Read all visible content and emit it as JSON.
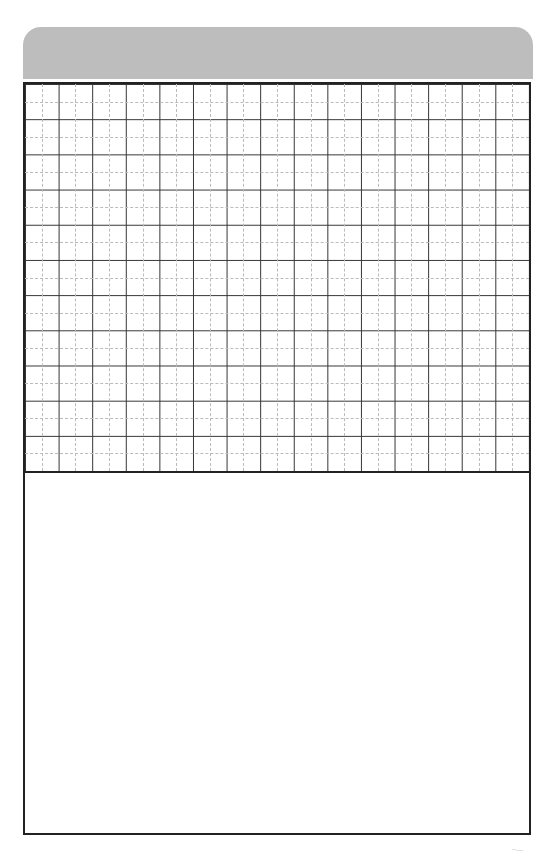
{
  "page": {
    "header_band_color": "#bdbdbd",
    "border_color": "#222222",
    "grid": {
      "columns": 15,
      "rows": 11,
      "solid_line_color": "#333333",
      "dashed_line_color": "#bbbbbb"
    },
    "corner_mark": "~—"
  }
}
